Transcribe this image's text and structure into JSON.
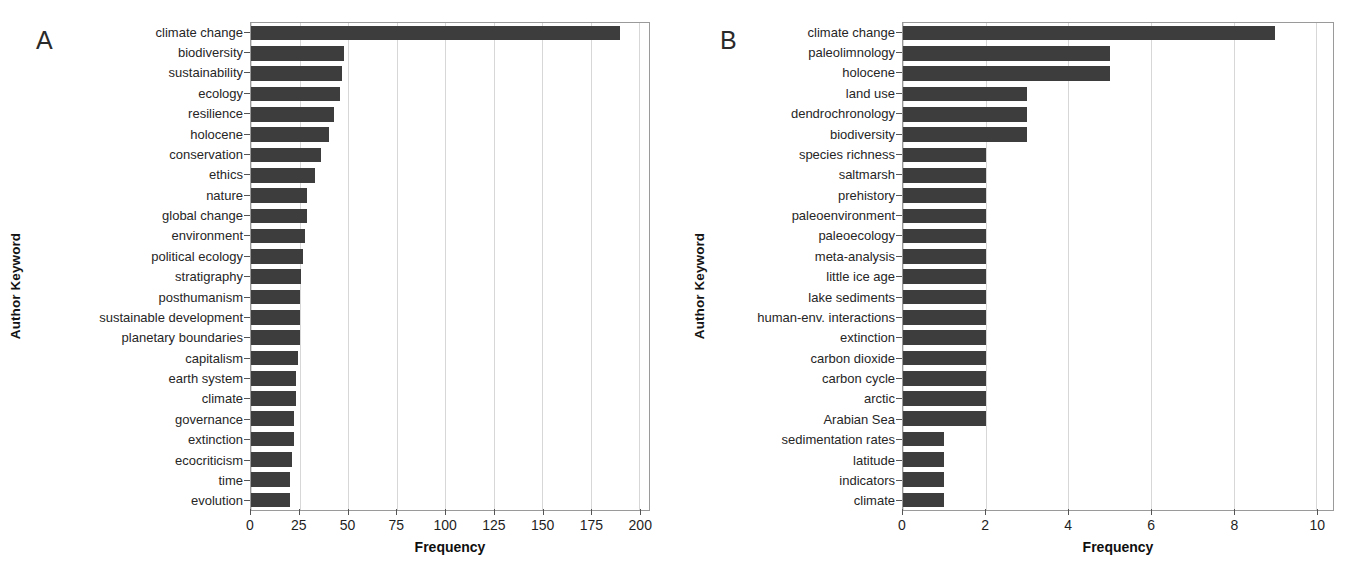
{
  "figure": {
    "background": "#ffffff",
    "bar_color": "#3d3d3d",
    "grid_color": "#d7d7d7",
    "axis_color": "#9a9a9a"
  },
  "panels": [
    {
      "letter": "A",
      "ylabel": "Author Keyword",
      "xlabel": "Frequency"
    },
    {
      "letter": "B",
      "ylabel": "Author Keyword",
      "xlabel": "Frequency"
    }
  ],
  "chart_data": [
    {
      "type": "bar",
      "orientation": "horizontal",
      "panel": "A",
      "title": "",
      "xlabel": "Frequency",
      "ylabel": "Author Keyword",
      "xlim": [
        0,
        205
      ],
      "xticks": [
        0,
        25,
        50,
        75,
        100,
        125,
        150,
        175,
        200
      ],
      "xticklabels": [
        "0",
        "25",
        "50",
        "75",
        "100",
        "125",
        "150",
        "175",
        "200"
      ],
      "grid": true,
      "legend": "none",
      "categories": [
        "climate change",
        "biodiversity",
        "sustainability",
        "ecology",
        "resilience",
        "holocene",
        "conservation",
        "ethics",
        "nature",
        "global change",
        "environment",
        "political ecology",
        "stratigraphy",
        "posthumanism",
        "sustainable development",
        "planetary boundaries",
        "capitalism",
        "earth system",
        "climate",
        "governance",
        "extinction",
        "ecocriticism",
        "time",
        "evolution"
      ],
      "values": [
        190,
        48,
        47,
        46,
        43,
        40,
        36,
        33,
        29,
        29,
        28,
        27,
        26,
        25,
        25,
        25,
        24,
        23,
        23,
        22,
        22,
        21,
        20,
        20
      ]
    },
    {
      "type": "bar",
      "orientation": "horizontal",
      "panel": "B",
      "title": "",
      "xlabel": "Frequency",
      "ylabel": "Author Keyword",
      "xlim": [
        0,
        10.4
      ],
      "xticks": [
        0,
        2,
        4,
        6,
        8,
        10
      ],
      "xticklabels": [
        "0",
        "2",
        "4",
        "6",
        "8",
        "10"
      ],
      "grid": true,
      "legend": "none",
      "categories": [
        "climate change",
        "paleolimnology",
        "holocene",
        "land use",
        "dendrochronology",
        "biodiversity",
        "species richness",
        "saltmarsh",
        "prehistory",
        "paleoenvironment",
        "paleoecology",
        "meta-analysis",
        "little ice age",
        "lake sediments",
        "human-env. interactions",
        "extinction",
        "carbon dioxide",
        "carbon cycle",
        "arctic",
        "Arabian Sea",
        "sedimentation rates",
        "latitude",
        "indicators",
        "climate"
      ],
      "values": [
        9,
        5,
        5,
        3,
        3,
        3,
        2,
        2,
        2,
        2,
        2,
        2,
        2,
        2,
        2,
        2,
        2,
        2,
        2,
        2,
        1,
        1,
        1,
        1
      ]
    }
  ]
}
